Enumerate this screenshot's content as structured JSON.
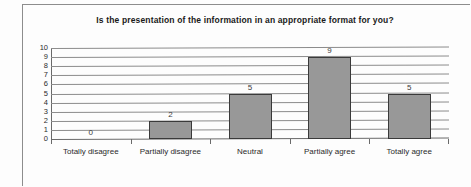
{
  "chart_data": {
    "type": "bar",
    "title": "Is the presentation of the information in an appropriate format for you?",
    "categories": [
      "Totally disagree",
      "Partially disagree",
      "Neutral",
      "Partially agree",
      "Totally agree"
    ],
    "values": [
      0,
      2,
      5,
      9,
      5
    ],
    "xlabel": "",
    "ylabel": "",
    "ylim": [
      0,
      10
    ],
    "yticks": [
      10,
      9,
      8,
      7,
      6,
      5,
      4,
      3,
      2,
      1,
      0
    ],
    "grid": true,
    "legend": false,
    "colors": {
      "bar_fill": "#989898",
      "bar_border": "#3a3a3a",
      "gridline": "#8c8c8c",
      "axis": "#6a6a6a",
      "text": "#2b2b2b",
      "background": "#fdfdfd",
      "frame": "#8d8d8d"
    }
  }
}
